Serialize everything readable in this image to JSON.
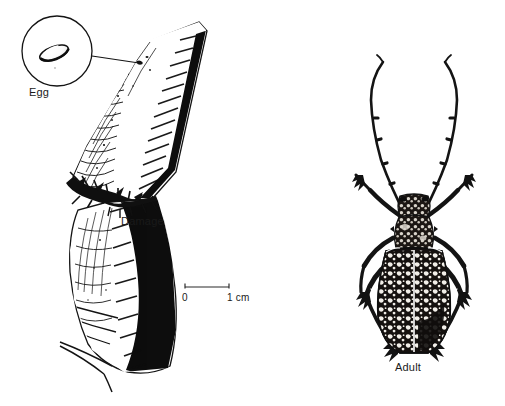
{
  "figure": {
    "caption_labels": {
      "egg": "Egg",
      "damage": "Damage",
      "adult": "Adult"
    },
    "scale_bar": {
      "start_label": "0",
      "end_label": "1 cm",
      "length_cm": 1
    },
    "colors": {
      "ink": "#111111",
      "background": "#ffffff",
      "line": "#1a1a1a"
    }
  }
}
